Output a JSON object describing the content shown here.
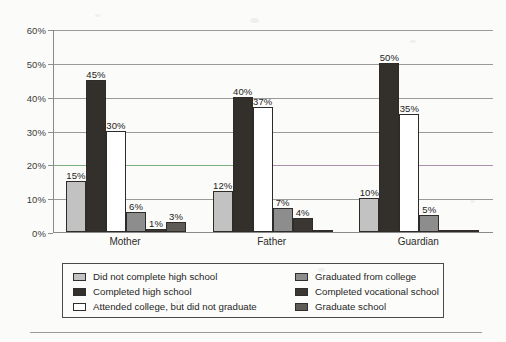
{
  "chart_data": {
    "type": "bar",
    "title": "",
    "subtitle": "",
    "xlabel": "",
    "ylabel": "",
    "categories": [
      "Mother",
      "Father",
      "Guardian"
    ],
    "ylim": [
      0,
      60
    ],
    "ytick_values": [
      0,
      10,
      20,
      30,
      40,
      50,
      60
    ],
    "ytick_labels": [
      "0%",
      "10%",
      "20%",
      "30%",
      "40%",
      "50%",
      "60%"
    ],
    "grid": true,
    "grid_axis": "y",
    "legend_position": "below",
    "value_suffix": "%",
    "series": [
      {
        "name": "Did not complete high school",
        "color": "#c2c2c2",
        "values": [
          15,
          12,
          10
        ],
        "labels": [
          "15%",
          "12%",
          "10%"
        ]
      },
      {
        "name": "Completed high school",
        "color": "#33302b",
        "values": [
          45,
          40,
          50
        ],
        "labels": [
          "45%",
          "40%",
          "50%"
        ]
      },
      {
        "name": "Attended college, but did not graduate",
        "color": "#ffffff",
        "values": [
          30,
          37,
          35
        ],
        "labels": [
          "30%",
          "37%",
          "35%"
        ]
      },
      {
        "name": "Graduated from college",
        "color": "#8d8d8d",
        "values": [
          6,
          7,
          5
        ],
        "labels": [
          "6%",
          "7%",
          "5%"
        ]
      },
      {
        "name": "Completed vocational school",
        "color": "#3a3733",
        "values": [
          1,
          4,
          0
        ],
        "labels": [
          "1%",
          "4%",
          ""
        ]
      },
      {
        "name": "Graduate school",
        "color": "#5e5b57",
        "values": [
          3,
          0,
          0
        ],
        "labels": [
          "3%",
          "",
          ""
        ]
      }
    ],
    "gridline_colors": {
      "10": "#9a9a9a",
      "20": "#7fb07f",
      "30": "#9a9a9a",
      "40": "#9a9a9a",
      "50": "#9a9a9a",
      "60": "#9a9a9a"
    },
    "accent_gridline_note": "20% gridline rendered green at left half and mauve at right half (scan artifact)"
  },
  "legend": {
    "columns": [
      {
        "items": [
          {
            "label": "Did not complete high school",
            "swatch": "#c2c2c2"
          },
          {
            "label": "Completed high school",
            "swatch": "#33302b"
          },
          {
            "label": "Attended college, but did not graduate",
            "swatch": "#ffffff"
          }
        ]
      },
      {
        "items": [
          {
            "label": "Graduated from college",
            "swatch": "#8d8d8d"
          },
          {
            "label": "Completed vocational school",
            "swatch": "#3a3733"
          },
          {
            "label": "Graduate school",
            "swatch": "#5e5b57"
          }
        ]
      }
    ]
  },
  "axis": {
    "y_ticks": [
      "60%",
      "50%",
      "40%",
      "30%",
      "20%",
      "10%",
      "0%"
    ],
    "x_ticks": [
      "Mother",
      "Father",
      "Guardian"
    ]
  }
}
